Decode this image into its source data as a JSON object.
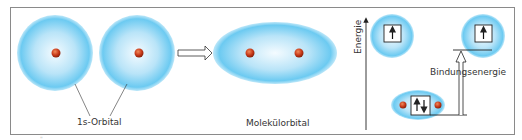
{
  "diagram": {
    "labels": {
      "atomic_orbital": "1s-Orbital",
      "molecular_orbital": "Molekülorbital",
      "energy_axis": "Energie",
      "binding_energy": "Bindungsenergie"
    },
    "stray_mark": "\"",
    "colors": {
      "orbital_center": "#ffffff",
      "orbital_edge": "#5fc3ef",
      "nucleus": "#c83a1a",
      "frame": "#8a8a8a",
      "lines": "#222222"
    },
    "electrons": {
      "atom_left": "up",
      "atom_right": "up",
      "molecule": "up-down"
    }
  }
}
